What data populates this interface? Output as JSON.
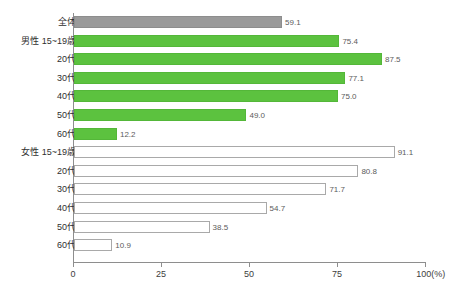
{
  "chart_data": {
    "type": "bar",
    "orientation": "horizontal",
    "title": "",
    "xlabel": "",
    "ylabel": "",
    "xlim": [
      0,
      100
    ],
    "xticks": [
      0,
      25,
      50,
      75,
      100
    ],
    "xtick_labels": [
      "0",
      "25",
      "50",
      "75",
      "100(%)"
    ],
    "unit_label": "(%)",
    "grid": false,
    "legend": "none",
    "categories": [
      "全体",
      "男性 15~19歳",
      "20代",
      "30代",
      "40代",
      "50代",
      "60代",
      "女性 15~19歳",
      "20代",
      "30代",
      "40代",
      "50代",
      "60代"
    ],
    "values": [
      59.1,
      75.4,
      87.5,
      77.1,
      75.0,
      49.0,
      12.2,
      91.1,
      80.8,
      71.7,
      54.7,
      38.5,
      10.9
    ],
    "value_labels": [
      "59.1",
      "75.4",
      "87.5",
      "77.1",
      "75.0",
      "49.0",
      "12.2",
      "91.1",
      "80.8",
      "71.7",
      "54.7",
      "38.5",
      "10.9"
    ],
    "groups": [
      "total",
      "male",
      "male",
      "male",
      "male",
      "male",
      "male",
      "female",
      "female",
      "female",
      "female",
      "female",
      "female"
    ],
    "colors": {
      "total": "#9a9a9a",
      "male": "#5cc23f",
      "female": "#ffffff",
      "female_border": "#a9a9a9",
      "axis": "#8e8e8e",
      "text": "#2f2f2f",
      "value_text": "#5b5b5b"
    },
    "rows": [
      {
        "label": "全体",
        "value": 59.1,
        "value_label": "59.1",
        "group": "total"
      },
      {
        "label": "男性 15~19歳",
        "value": 75.4,
        "value_label": "75.4",
        "group": "male"
      },
      {
        "label": "20代",
        "value": 87.5,
        "value_label": "87.5",
        "group": "male"
      },
      {
        "label": "30代",
        "value": 77.1,
        "value_label": "77.1",
        "group": "male"
      },
      {
        "label": "40代",
        "value": 75.0,
        "value_label": "75.0",
        "group": "male"
      },
      {
        "label": "50代",
        "value": 49.0,
        "value_label": "49.0",
        "group": "male"
      },
      {
        "label": "60代",
        "value": 12.2,
        "value_label": "12.2",
        "group": "male"
      },
      {
        "label": "女性 15~19歳",
        "value": 91.1,
        "value_label": "91.1",
        "group": "female"
      },
      {
        "label": "20代",
        "value": 80.8,
        "value_label": "80.8",
        "group": "female"
      },
      {
        "label": "30代",
        "value": 71.7,
        "value_label": "71.7",
        "group": "female"
      },
      {
        "label": "40代",
        "value": 54.7,
        "value_label": "54.7",
        "group": "female"
      },
      {
        "label": "50代",
        "value": 38.5,
        "value_label": "38.5",
        "group": "female"
      },
      {
        "label": "60代",
        "value": 10.9,
        "value_label": "10.9",
        "group": "female"
      }
    ]
  }
}
